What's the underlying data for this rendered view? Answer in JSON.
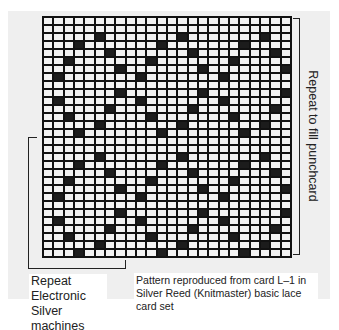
{
  "figure": {
    "grid": {
      "columns": 24,
      "rows": 30,
      "cell_colors": {
        "punched": "#1c1c1c",
        "blank": "#f2f2f2",
        "lines": "#111111"
      },
      "punched_cells_by_row": [
        [],
        [],
        [
          5,
          13,
          21
        ],
        [
          3,
          11,
          19
        ],
        [
          6,
          14,
          22
        ],
        [
          2,
          10,
          18
        ],
        [
          7,
          15,
          23
        ],
        [
          1,
          9,
          17
        ],
        [],
        [
          7,
          15,
          23
        ],
        [
          1,
          9,
          17
        ],
        [
          6,
          14,
          22
        ],
        [
          2,
          10,
          18
        ],
        [
          5,
          13,
          21
        ],
        [
          3,
          11,
          19
        ],
        [],
        [],
        [
          5,
          13,
          21
        ],
        [
          3,
          11,
          19
        ],
        [
          6,
          14,
          22
        ],
        [
          2,
          10,
          18
        ],
        [
          7,
          15,
          23
        ],
        [
          1,
          9,
          17
        ],
        [],
        [
          7,
          15,
          23
        ],
        [
          1,
          9,
          17
        ],
        [
          6,
          14,
          22
        ],
        [
          2,
          10,
          18
        ],
        [
          5,
          13,
          21
        ],
        [
          3,
          11,
          19
        ]
      ]
    },
    "right_bracket_label": "Repeat to fill punchcard",
    "left_caption": [
      "Repeat Electronic",
      "Silver machines"
    ],
    "right_caption": [
      "Pattern reproduced from card L–1 in",
      "Silver Reed (Knitmaster) basic lace",
      "card set"
    ]
  }
}
